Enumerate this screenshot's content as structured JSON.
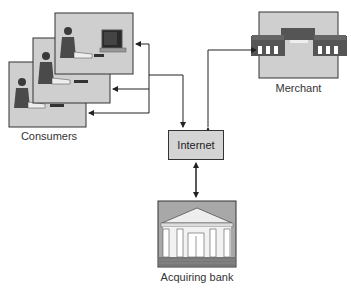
{
  "diagram": {
    "title": "",
    "nodes": {
      "consumers": {
        "label": "Consumers",
        "icon": "person-at-computer-icon",
        "count": 3
      },
      "internet": {
        "label": "Internet"
      },
      "merchant": {
        "label": "Merchant",
        "icon": "storefront-building-icon"
      },
      "acquiring_bank": {
        "label": "Acquiring bank",
        "icon": "bank-building-icon"
      }
    },
    "edges": [
      {
        "from": "internet",
        "to": "consumers",
        "type": "bidirectional-branching"
      },
      {
        "from": "internet",
        "to": "merchant",
        "type": "bidirectional"
      },
      {
        "from": "internet",
        "to": "acquiring_bank",
        "type": "bidirectional"
      }
    ]
  },
  "colors": {
    "box_fill": "#cfcfcf",
    "box_stroke": "#333333",
    "dark_fill": "#555555",
    "line": "#333333"
  }
}
